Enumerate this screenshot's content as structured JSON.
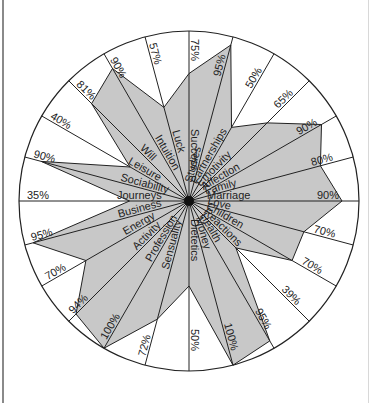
{
  "chart_data": {
    "type": "radar",
    "title": "",
    "center": [
      189,
      201
    ],
    "radius": 170,
    "fill_color": "#c8c8c8",
    "line_color": "#222222",
    "categories": [
      "Success",
      "Studies",
      "Partnerships",
      "Emotivity",
      "Affection",
      "Family",
      "Marriage",
      "Love",
      "Children",
      "Reactions",
      "Health",
      "Money",
      "Dietetics",
      "Sensuality",
      "Profession",
      "Activity",
      "Energy",
      "Business",
      "Journeys",
      "Sociability",
      "Leisure",
      "Will",
      "Intuition",
      "Luck"
    ],
    "values": [
      75,
      95,
      50,
      65,
      90,
      80,
      90,
      70,
      70,
      39,
      95,
      100,
      50,
      72,
      100,
      94,
      70,
      95,
      35,
      90,
      40,
      81,
      90,
      57
    ],
    "value_labels": [
      "75%",
      "95%",
      "50%",
      "65%",
      "90%",
      "80%",
      "90%",
      "70%",
      "70%",
      "39%",
      "95%",
      "100%",
      "50%",
      "72%",
      "100%",
      "94%",
      "70%",
      "95%",
      "35%",
      "90%",
      "40%",
      "81%",
      "90%",
      "57%"
    ],
    "range": [
      0,
      100
    ],
    "grid": false,
    "legend": "none"
  }
}
